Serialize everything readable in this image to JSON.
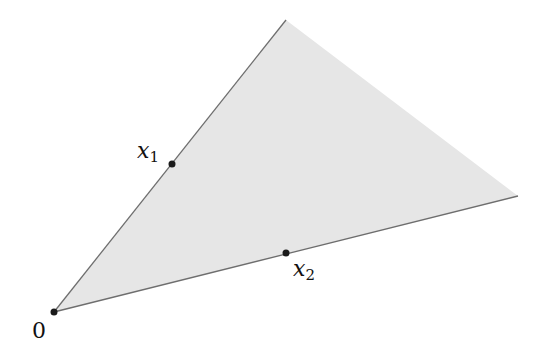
{
  "diagram": {
    "type": "cone",
    "colors": {
      "fill": "#e6e6e6",
      "edge": "#6e6e6e",
      "point": "#1a1a1a",
      "text": "#111111"
    },
    "vertices": {
      "origin": [
        54,
        312
      ],
      "apex": [
        286,
        20
      ],
      "right": [
        518,
        196
      ]
    },
    "points": [
      {
        "name": "origin",
        "x": 54,
        "y": 312
      },
      {
        "name": "x1",
        "x": 172,
        "y": 164
      },
      {
        "name": "x2",
        "x": 286,
        "y": 253
      }
    ],
    "labels": {
      "origin": "0",
      "x1_var": "x",
      "x1_sub": "1",
      "x2_var": "x",
      "x2_sub": "2"
    }
  }
}
